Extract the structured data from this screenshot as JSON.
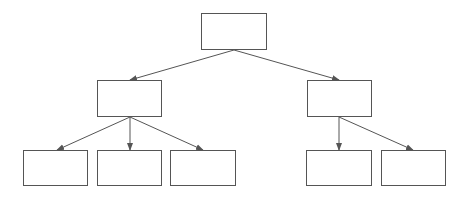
{
  "diagram": {
    "title": "",
    "type": "tree",
    "colors": {
      "stroke": "#555555",
      "background": "#ffffff",
      "fill": "#ffffff"
    },
    "nodes": [
      {
        "id": "root",
        "label": "",
        "x": 201,
        "y": 13,
        "w": 66,
        "h": 37
      },
      {
        "id": "left",
        "label": "",
        "x": 97,
        "y": 80,
        "w": 65,
        "h": 37
      },
      {
        "id": "right",
        "label": "",
        "x": 307,
        "y": 80,
        "w": 65,
        "h": 37
      },
      {
        "id": "left-1",
        "label": "",
        "x": 23,
        "y": 150,
        "w": 65,
        "h": 36
      },
      {
        "id": "left-2",
        "label": "",
        "x": 97,
        "y": 150,
        "w": 65,
        "h": 36
      },
      {
        "id": "left-3",
        "label": "",
        "x": 170,
        "y": 150,
        "w": 66,
        "h": 36
      },
      {
        "id": "right-1",
        "label": "",
        "x": 306,
        "y": 150,
        "w": 66,
        "h": 36
      },
      {
        "id": "right-2",
        "label": "",
        "x": 381,
        "y": 150,
        "w": 65,
        "h": 36
      }
    ],
    "edges": [
      {
        "from": "root",
        "to": "left",
        "x1": 234,
        "y1": 50,
        "x2": 130,
        "y2": 80
      },
      {
        "from": "root",
        "to": "right",
        "x1": 234,
        "y1": 50,
        "x2": 339,
        "y2": 80
      },
      {
        "from": "left",
        "to": "left-1",
        "x1": 130,
        "y1": 117,
        "x2": 57,
        "y2": 150
      },
      {
        "from": "left",
        "to": "left-2",
        "x1": 130,
        "y1": 117,
        "x2": 130,
        "y2": 150
      },
      {
        "from": "left",
        "to": "left-3",
        "x1": 130,
        "y1": 117,
        "x2": 203,
        "y2": 150
      },
      {
        "from": "right",
        "to": "right-1",
        "x1": 339,
        "y1": 117,
        "x2": 339,
        "y2": 150
      },
      {
        "from": "right",
        "to": "right-2",
        "x1": 339,
        "y1": 117,
        "x2": 413,
        "y2": 150
      }
    ]
  }
}
